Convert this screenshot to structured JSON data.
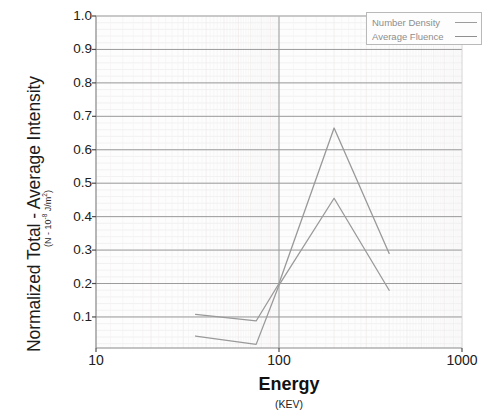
{
  "chart_data": {
    "type": "line",
    "title": "",
    "xlabel": "Energy",
    "xlabel_sub": "(KEV)",
    "ylabel": "Normalized Total - Average Intensity",
    "ylabel_sub": "(N - 10-8 J/m2)",
    "xscale": "log",
    "yscale": "linear",
    "xlim": [
      10,
      1000
    ],
    "ylim": [
      0.0,
      1.0
    ],
    "xticks": [
      "10",
      "100",
      "1000"
    ],
    "xtick_values": [
      10,
      100,
      1000
    ],
    "yticks": [
      "0.1",
      "0.2",
      "0.3",
      "0.4",
      "0.5",
      "0.6",
      "0.7",
      "0.8",
      "0.9",
      "1.0"
    ],
    "ytick_values": [
      0.1,
      0.2,
      0.3,
      0.4,
      0.5,
      0.6,
      0.7,
      0.8,
      0.9,
      1.0
    ],
    "grid": true,
    "minor_grid": true,
    "legend_position": "top-right",
    "series": [
      {
        "name": "Number Density",
        "color": "#999999",
        "x": [
          35,
          75,
          100,
          200,
          400
        ],
        "values": [
          0.108,
          0.088,
          0.2,
          0.665,
          0.29
        ]
      },
      {
        "name": "Average Fluence",
        "color": "#9a9a9a",
        "x": [
          35,
          75,
          100,
          200,
          400
        ],
        "values": [
          0.043,
          0.018,
          0.195,
          0.455,
          0.18
        ]
      }
    ]
  },
  "axes": {
    "y_title": "Normalized Total - Average Intensity",
    "y_subtitle_prefix": "(N - 10",
    "y_subtitle_exp": "-8",
    "y_subtitle_suffix": " J/m",
    "y_subtitle_exp2": "2",
    "y_subtitle_end": ")",
    "x_title": "Energy",
    "x_subtitle": "(KEV)"
  },
  "legend": {
    "items": [
      {
        "label": "Number Density",
        "color": "#9c9c9c"
      },
      {
        "label": "Average Fluence",
        "color": "#8f8f8f"
      }
    ]
  },
  "colors": {
    "plot_border": "#8a8a8a",
    "major_grid": "#9b9b9b",
    "minor_grid": "#ececec",
    "minor_grid_v": "#efe9e9",
    "background": "#ffffff",
    "plot_background": "#fdfdfd",
    "legend_border": "#b9b9b9",
    "legend_text": "#8d8d8d"
  },
  "geometry": {
    "plot_left": 96,
    "plot_right": 462,
    "plot_top": 16,
    "plot_bottom": 348,
    "y_zero_px": 350.4,
    "y_one_px": 16
  }
}
